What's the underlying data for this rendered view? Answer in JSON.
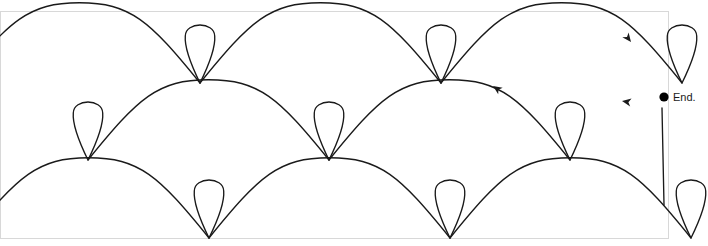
{
  "figure": {
    "title": "",
    "background_color": "#ffffff",
    "frame": {
      "color": "#d8d8d8",
      "x": 0.5,
      "y": 11.5,
      "width": 668,
      "height": 227
    },
    "stroke_color": "#1a1a1a",
    "stroke_width": 1.35,
    "labels": {
      "end_label": "End."
    },
    "markers": {
      "end_dot": {
        "x": 664,
        "y": 97,
        "radius": 4.6,
        "color": "#000000"
      },
      "end_text": {
        "x": 673,
        "y": 101
      }
    },
    "arrowheads": [
      {
        "name": "arrow-top-right",
        "x": 631,
        "y": 42,
        "angle": 52
      },
      {
        "name": "arrow-middle",
        "x": 493,
        "y": 86,
        "angle": 214
      },
      {
        "name": "arrow-right-lower",
        "x": 622,
        "y": 101,
        "angle": 190
      }
    ],
    "rows": [
      {
        "name": "row-top",
        "baseline_y": 83,
        "arc_radius_y": 68,
        "period": 241,
        "loop_direction": "up",
        "loop_width": 30,
        "loop_height": 56,
        "peak_offsets": [
          -41,
          200,
          441,
          682
        ]
      },
      {
        "name": "row-middle",
        "baseline_y": 160,
        "arc_radius_y": 68,
        "period": 241,
        "loop_direction": "up",
        "loop_width": 30,
        "loop_height": 56,
        "peak_offsets": [
          88,
          329,
          570
        ]
      },
      {
        "name": "row-bottom",
        "baseline_y": 238,
        "arc_radius_y": 68,
        "period": 241,
        "loop_direction": "up",
        "loop_width": 30,
        "loop_height": 56,
        "peak_offsets": [
          -32,
          209,
          450,
          691
        ]
      }
    ],
    "return_line": {
      "name": "vertical-return-line",
      "x1": 662,
      "y1": 108,
      "x2": 664,
      "y2": 205
    }
  }
}
